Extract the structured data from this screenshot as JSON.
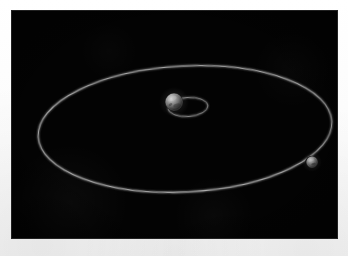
{
  "page": {
    "background_color": "#ffffff",
    "caption": ""
  },
  "viewport": {
    "label": "orbital-simulation-viewport",
    "background_color": "#030303",
    "width": 327,
    "height": 229,
    "x": 11,
    "y": 10
  },
  "scene": {
    "title": "",
    "view": "3D perspective, orbital plane tilted toward viewer",
    "orbit_line_color": "#b8b8b8",
    "body_color": "#8d8d8d",
    "objects": [
      {
        "name": "central-body",
        "label": "",
        "type": "planet",
        "cx": 163,
        "cy": 92,
        "radius": 8.5,
        "color": "#8d8d8d"
      },
      {
        "name": "satellite-body",
        "label": "",
        "type": "satellite",
        "cx": 301,
        "cy": 152,
        "radius": 5.5,
        "color": "#9a9a9a"
      }
    ],
    "orbits": [
      {
        "name": "outer-orbit",
        "label": "",
        "cx": 174,
        "cy": 119,
        "rx": 147,
        "ry": 63,
        "rotation_deg": -3,
        "stroke": "#bdbdbd",
        "stroke_width": 1.1
      },
      {
        "name": "inner-orbit",
        "label": "",
        "cx": 177,
        "cy": 97,
        "rx": 20,
        "ry": 9.5,
        "rotation_deg": -4,
        "stroke": "#a8a8a8",
        "stroke_width": 1
      }
    ]
  },
  "chart_data": {
    "type": "scatter",
    "title": "",
    "xlabel": "",
    "ylabel": "",
    "description": "3D rendered orbital diagram: a central grey spherical body at the focus of a small inner elliptical orbit, surrounded by a much larger tilted elliptical orbit on which a single small satellite body travels.",
    "series": [
      {
        "name": "outer-orbit-path",
        "kind": "ellipse",
        "center": [
          174,
          119
        ],
        "semi_major": 147,
        "semi_minor": 63,
        "rotation_deg": -3
      },
      {
        "name": "inner-orbit-path",
        "kind": "ellipse",
        "center": [
          177,
          97
        ],
        "semi_major": 20,
        "semi_minor": 9.5,
        "rotation_deg": -4
      },
      {
        "name": "bodies",
        "kind": "points",
        "x": [
          163,
          301
        ],
        "y": [
          92,
          152
        ],
        "labels": [
          "central-body",
          "satellite-body"
        ]
      }
    ],
    "legend": [],
    "grid": false,
    "xlim": [
      0,
      327
    ],
    "ylim": [
      0,
      229
    ]
  }
}
